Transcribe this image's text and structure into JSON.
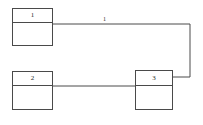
{
  "diagram": {
    "type": "block-diagram",
    "canvas": {
      "width": 203,
      "height": 125,
      "background": "#ffffff"
    },
    "line_color": "#4a4a4a",
    "text_color": "#2b2b2b",
    "nodes": [
      {
        "id": "node-1",
        "label": "1",
        "x": 12,
        "y": 8,
        "width": 41,
        "height": 38,
        "header_height": 14
      },
      {
        "id": "node-2",
        "label": "2",
        "x": 12,
        "y": 71,
        "width": 41,
        "height": 39,
        "header_height": 14
      },
      {
        "id": "node-3",
        "label": "3",
        "x": 135,
        "y": 70,
        "width": 38,
        "height": 40,
        "header_height": 15
      }
    ],
    "edges": [
      {
        "id": "edge-1-to-3",
        "from": "node-1",
        "to": "node-3",
        "label": "1",
        "label_x": 103,
        "label_y": 16,
        "path": "M 53 24 L 190 24 L 190 77 L 173 77"
      },
      {
        "id": "edge-2-to-3",
        "from": "node-2",
        "to": "node-3",
        "label": "",
        "path": "M 53 86 L 135 86"
      }
    ]
  }
}
